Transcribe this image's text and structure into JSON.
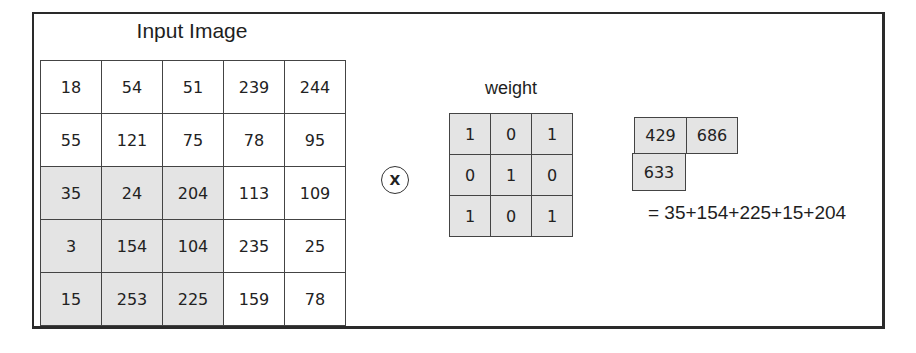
{
  "input_image": {
    "title": "Input Image",
    "rows": [
      [
        "18",
        "54",
        "51",
        "239",
        "244"
      ],
      [
        "55",
        "121",
        "75",
        "78",
        "95"
      ],
      [
        "35",
        "24",
        "204",
        "113",
        "109"
      ],
      [
        "3",
        "154",
        "104",
        "235",
        "25"
      ],
      [
        "15",
        "253",
        "225",
        "159",
        "78"
      ]
    ],
    "highlighted_region": {
      "rows": [
        2,
        3,
        4
      ],
      "cols": [
        0,
        1,
        2
      ]
    }
  },
  "operator": {
    "symbol": "X",
    "icon": "multiply-circle-icon"
  },
  "weight": {
    "label": "weight",
    "rows": [
      [
        "1",
        "0",
        "1"
      ],
      [
        "0",
        "1",
        "0"
      ],
      [
        "1",
        "0",
        "1"
      ]
    ]
  },
  "output": {
    "values": [
      "429",
      "686",
      "633"
    ],
    "equation": "= 35+154+225+15+204"
  },
  "colors": {
    "shaded_cell": "#e4e4e4",
    "border": "#444444",
    "frame": "#2a2a2a"
  }
}
